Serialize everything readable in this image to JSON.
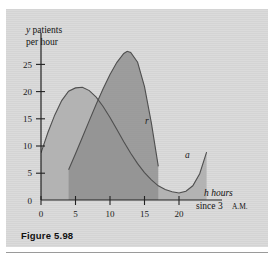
{
  "figure": {
    "caption": "Figure 5.98",
    "panel_color": "#d9d9d9",
    "page_background": "#ffffff"
  },
  "chart_data": {
    "type": "area",
    "title": "",
    "xlabel_line1": "h hours",
    "xlabel_line2_prefix": "since 3 ",
    "xlabel_line2_smallcaps": "A.M.",
    "ylabel_line1": "y patients",
    "ylabel_line2": "per hour",
    "xlim": [
      0,
      25.5
    ],
    "ylim": [
      0,
      29
    ],
    "xticks": [
      0,
      5,
      10,
      15,
      20
    ],
    "yticks": [
      0,
      5,
      10,
      15,
      20,
      25
    ],
    "grid": false,
    "legend": "inline-curve-labels",
    "series": [
      {
        "name": "a",
        "label": "a",
        "label_x": 24.1,
        "label_y": 11.2,
        "fill_color": "#b3b3b3",
        "stroke_color": "#4a4a4a",
        "description": "admissions rate curve; starts near 8.5 at h=0, peaks about 20.5 near h=6, falls to a minimum near 1.3 at h=20, rises to about 8.7 at h=24",
        "x": [
          0,
          1,
          2,
          3,
          4,
          5,
          6,
          7,
          8,
          9,
          10,
          11,
          12,
          13,
          14,
          15,
          16,
          17,
          18,
          19,
          20,
          21,
          22,
          23,
          24
        ],
        "y": [
          8.5,
          12.2,
          15.4,
          18.0,
          19.7,
          20.4,
          20.5,
          19.9,
          18.7,
          17.0,
          15.0,
          12.8,
          10.6,
          8.5,
          6.6,
          5.0,
          3.7,
          2.6,
          1.9,
          1.5,
          1.3,
          1.6,
          2.6,
          4.8,
          8.7
        ]
      },
      {
        "name": "r",
        "label": "r",
        "label_x": 17.6,
        "label_y": 15.6,
        "fill_color": "#8f8f8f",
        "stroke_color": "#4a4a4a",
        "description": "release rate curve; rises from about 5.5 at h=4, peaks about 27 near h=12.5, falls to about 6 at h=17 then drops to zero",
        "x": [
          4,
          5,
          6,
          7,
          8,
          9,
          10,
          11,
          12,
          12.5,
          13,
          14,
          15,
          16,
          17
        ],
        "y": [
          5.5,
          8.4,
          11.4,
          14.4,
          17.4,
          20.2,
          22.8,
          25.0,
          26.6,
          27.0,
          26.8,
          25.0,
          20.6,
          13.8,
          6.0
        ]
      }
    ],
    "overlap_fill_color": "#6f6f6f",
    "annotations": [
      {
        "text": "r",
        "x": 17.6,
        "y": 15.6
      },
      {
        "text": "a",
        "x": 24.1,
        "y": 11.2
      }
    ]
  }
}
